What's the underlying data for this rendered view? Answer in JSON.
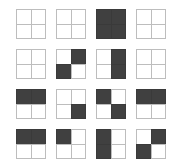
{
  "page": {
    "background_color": "#ffffff"
  },
  "palette": {
    "filled_color": "#404040",
    "empty_color": "#ffffff",
    "border_color": "#bdbdbd"
  },
  "grid": {
    "rows": 4,
    "columns": 4,
    "tile_size_px": 30,
    "gap_px": 10,
    "quadrant_order": [
      "top-left",
      "top-right",
      "bottom-left",
      "bottom-right"
    ],
    "tiles": [
      {
        "row": 1,
        "col": 1,
        "name": "tile-r1c1",
        "pattern": "empty",
        "quadrants": [
          0,
          0,
          0,
          0
        ]
      },
      {
        "row": 1,
        "col": 2,
        "name": "tile-r1c2",
        "pattern": "empty",
        "quadrants": [
          0,
          0,
          0,
          0
        ]
      },
      {
        "row": 1,
        "col": 3,
        "name": "tile-r1c3",
        "pattern": "full",
        "quadrants": [
          1,
          1,
          1,
          1
        ]
      },
      {
        "row": 1,
        "col": 4,
        "name": "tile-r1c4",
        "pattern": "empty",
        "quadrants": [
          0,
          0,
          0,
          0
        ]
      },
      {
        "row": 2,
        "col": 1,
        "name": "tile-r2c1",
        "pattern": "empty",
        "quadrants": [
          0,
          0,
          0,
          0
        ]
      },
      {
        "row": 2,
        "col": 2,
        "name": "tile-r2c2",
        "pattern": "anti-diagonal",
        "quadrants": [
          0,
          1,
          1,
          0
        ]
      },
      {
        "row": 2,
        "col": 3,
        "name": "tile-r2c3",
        "pattern": "right-half",
        "quadrants": [
          0,
          1,
          0,
          1
        ]
      },
      {
        "row": 2,
        "col": 4,
        "name": "tile-r2c4",
        "pattern": "empty",
        "quadrants": [
          0,
          0,
          0,
          0
        ]
      },
      {
        "row": 3,
        "col": 1,
        "name": "tile-r3c1",
        "pattern": "top-half",
        "quadrants": [
          1,
          1,
          0,
          0
        ]
      },
      {
        "row": 3,
        "col": 2,
        "name": "tile-r3c2",
        "pattern": "bottom-right",
        "quadrants": [
          0,
          0,
          0,
          1
        ]
      },
      {
        "row": 3,
        "col": 3,
        "name": "tile-r3c3",
        "pattern": "main-diagonal",
        "quadrants": [
          1,
          0,
          0,
          1
        ]
      },
      {
        "row": 3,
        "col": 4,
        "name": "tile-r3c4",
        "pattern": "top-half",
        "quadrants": [
          1,
          1,
          0,
          0
        ]
      },
      {
        "row": 4,
        "col": 1,
        "name": "tile-r4c1",
        "pattern": "top-half",
        "quadrants": [
          1,
          1,
          0,
          0
        ]
      },
      {
        "row": 4,
        "col": 2,
        "name": "tile-r4c2",
        "pattern": "top-left",
        "quadrants": [
          1,
          0,
          0,
          0
        ]
      },
      {
        "row": 4,
        "col": 3,
        "name": "tile-r4c3",
        "pattern": "left-half",
        "quadrants": [
          1,
          0,
          1,
          0
        ]
      },
      {
        "row": 4,
        "col": 4,
        "name": "tile-r4c4",
        "pattern": "anti-diagonal",
        "quadrants": [
          0,
          1,
          1,
          0
        ]
      }
    ]
  }
}
